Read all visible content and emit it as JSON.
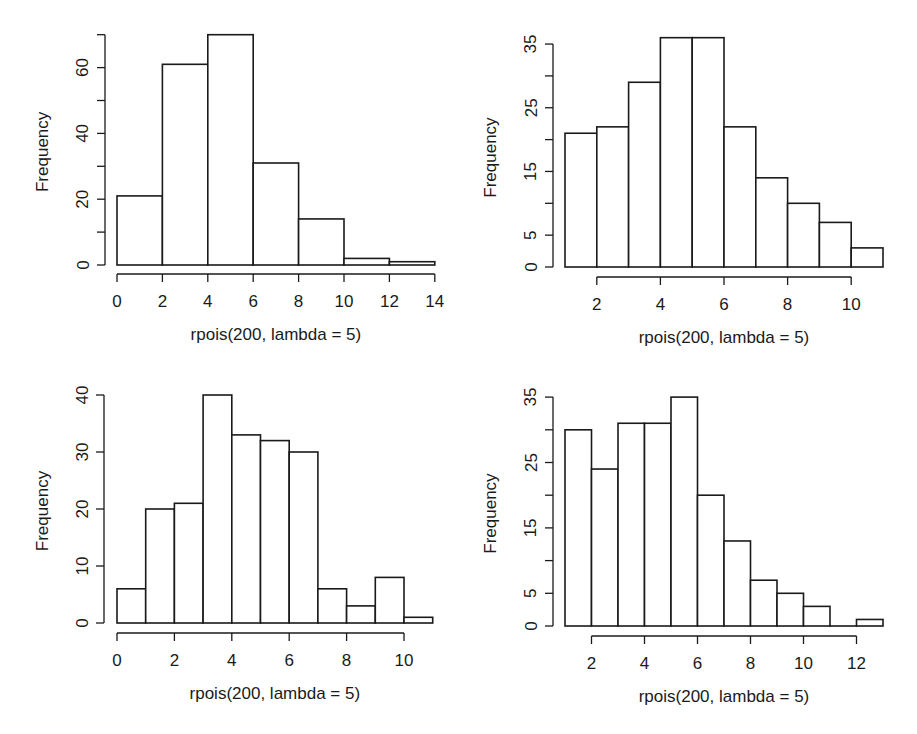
{
  "chart_data": [
    {
      "type": "bar",
      "title": "",
      "xlabel": "rpois(200, lambda = 5)",
      "ylabel": "Frequency",
      "bin_edges": [
        0,
        2,
        4,
        6,
        8,
        10,
        12,
        14
      ],
      "values": [
        21,
        61,
        70,
        31,
        14,
        2,
        1
      ],
      "xticks": [
        0,
        2,
        4,
        6,
        8,
        10,
        12,
        14
      ],
      "yticks": [
        0,
        10,
        20,
        30,
        40,
        50,
        60,
        70
      ],
      "ytick_labels": [
        "0",
        "",
        "20",
        "",
        "40",
        "",
        "60",
        ""
      ],
      "ylim": [
        0,
        70
      ],
      "grid": false
    },
    {
      "type": "bar",
      "title": "",
      "xlabel": "rpois(200, lambda = 5)",
      "ylabel": "Frequency",
      "bin_edges": [
        1,
        2,
        3,
        4,
        5,
        6,
        7,
        8,
        9,
        10,
        11
      ],
      "values": [
        21,
        22,
        29,
        36,
        36,
        22,
        14,
        10,
        7,
        3
      ],
      "xticks": [
        2,
        4,
        6,
        8,
        10
      ],
      "yticks": [
        0,
        5,
        10,
        15,
        20,
        25,
        30,
        35
      ],
      "ytick_labels": [
        "0",
        "5",
        "",
        "15",
        "",
        "25",
        "",
        "35"
      ],
      "ylim": [
        0,
        35
      ],
      "grid": false
    },
    {
      "type": "bar",
      "title": "",
      "xlabel": "rpois(200, lambda = 5)",
      "ylabel": "Frequency",
      "bin_edges": [
        0,
        1,
        2,
        3,
        4,
        5,
        6,
        7,
        8,
        9,
        10,
        11
      ],
      "values": [
        6,
        20,
        21,
        40,
        33,
        32,
        30,
        6,
        3,
        8,
        1
      ],
      "xticks": [
        0,
        2,
        4,
        6,
        8,
        10
      ],
      "yticks": [
        0,
        10,
        20,
        30,
        40
      ],
      "ytick_labels": [
        "0",
        "10",
        "20",
        "30",
        "40"
      ],
      "ylim": [
        0,
        40
      ],
      "grid": false
    },
    {
      "type": "bar",
      "title": "",
      "xlabel": "rpois(200, lambda = 5)",
      "ylabel": "Frequency",
      "bin_edges": [
        1,
        2,
        3,
        4,
        5,
        6,
        7,
        8,
        9,
        10,
        11,
        12,
        13
      ],
      "values": [
        30,
        24,
        31,
        31,
        35,
        20,
        13,
        7,
        5,
        3,
        0,
        1
      ],
      "xticks": [
        2,
        4,
        6,
        8,
        10,
        12
      ],
      "yticks": [
        0,
        5,
        10,
        15,
        20,
        25,
        30,
        35
      ],
      "ytick_labels": [
        "0",
        "5",
        "",
        "15",
        "",
        "25",
        "",
        "35"
      ],
      "ylim": [
        0,
        35
      ],
      "grid": false
    }
  ],
  "layout": [
    {
      "yaxis_x": 105,
      "y0": 265,
      "ypx_per_unit": 3.29,
      "x_origin_value": 0,
      "x_origin_px": 117,
      "xpx_per_unit": 22.7,
      "xaxis_y": 274
    },
    {
      "yaxis_x": 553,
      "y0": 267,
      "ypx_per_unit": 6.37,
      "x_origin_value": 1,
      "x_origin_px": 565,
      "xpx_per_unit": 31.8,
      "xaxis_y": 277
    },
    {
      "yaxis_x": 104,
      "y0": 623,
      "ypx_per_unit": 5.7,
      "x_origin_value": 0,
      "x_origin_px": 117,
      "xpx_per_unit": 28.7,
      "xaxis_y": 633
    },
    {
      "yaxis_x": 553,
      "y0": 626,
      "ypx_per_unit": 6.54,
      "x_origin_value": 1,
      "x_origin_px": 565,
      "xpx_per_unit": 26.5,
      "xaxis_y": 636
    }
  ]
}
